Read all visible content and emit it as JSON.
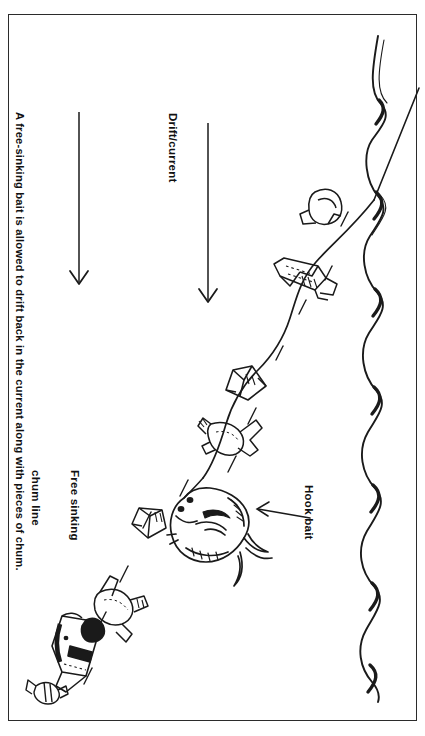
{
  "figure": {
    "type": "line-art-diagram",
    "orientation": "text rotated 90 degrees clockwise (page is landscape printed in portrait)",
    "background_color": "#ffffff",
    "ink_color": "#1a1a1a",
    "border_color": "#2b2b2b"
  },
  "caption": {
    "text": "A free-sinking bait is allowed to drift back in the current along with pieces of chum."
  },
  "labels": {
    "drift_current": "Drift/current",
    "free_sinking_chum_line_1": "Free sinking",
    "free_sinking_chum_line_2": "chum line",
    "hook_bait": "Hook bait"
  },
  "annotations": {
    "arrow_count": 2,
    "arrow_direction": "down (indicating current flow direction)",
    "hook_bait_pointer": "arrow pointing from label to the large baitfish",
    "water_surface": "wavy line along the right edge representing the sea surface",
    "fishing_line": "curved line running from the surface down-left to the hook bait",
    "chum_pieces": 6
  }
}
